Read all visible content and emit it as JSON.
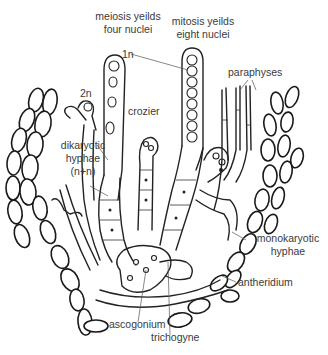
{
  "diagram": {
    "labels": {
      "meiosis": "meiosis yeilds\nfour nuclei",
      "meiosis_line1": "meiosis yeilds",
      "meiosis_line2": "four nuclei",
      "mitosis_line1": "mitosis yeilds",
      "mitosis_line2": "eight nuclei",
      "haploid": "1n",
      "diploid": "2n",
      "paraphyses": "paraphyses",
      "crozier": "crozier",
      "dikaryotic_line1": "dikaryotic",
      "dikaryotic_line2": "hyphae",
      "dikaryotic_line3": "(n+n)",
      "monokaryotic_line1": "monokaryotic",
      "monokaryotic_line2": "hyphae",
      "antheridium": "antheridium",
      "ascogonium": "ascogonium",
      "trichogyne": "trichogyne"
    },
    "colors": {
      "ink": "#222222",
      "label_text": "#3a3a3a",
      "background": "#ffffff"
    }
  }
}
